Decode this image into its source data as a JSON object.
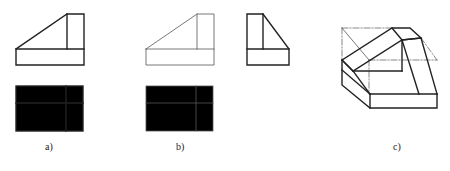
{
  "figure": {
    "panels": [
      {
        "id": "a",
        "label": "a)",
        "description": "Front view and top view of the given part (bold outline)"
      },
      {
        "id": "b",
        "label": "b)",
        "description": "Front view and top view repeated (thin lines) with the completed left side view"
      },
      {
        "id": "c",
        "label": "c)",
        "description": "Isometric pictorial of the part with chamfered top and construction lines"
      }
    ],
    "colors": {
      "line": "#222222",
      "thin_line": "#555555",
      "background": "#ffffff"
    }
  }
}
